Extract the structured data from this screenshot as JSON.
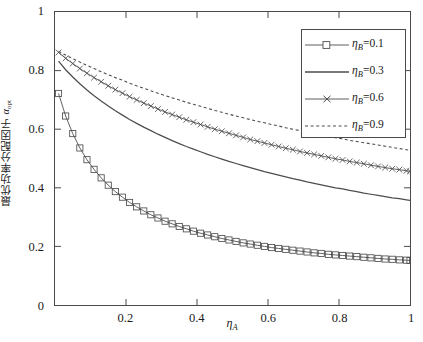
{
  "figure": {
    "background": "#ffffff",
    "axis_color": "#4a4a4a",
    "curve_color": "#4d4d4d"
  },
  "axes": {
    "x_label": "η",
    "x_label_sub": "A",
    "y_label_cn": "最优功率分配因子 ",
    "y_label_sym": "α",
    "y_label_sub": "opt",
    "x_ticks": [
      "0.2",
      "0.4",
      "0.6",
      "0.8",
      "1"
    ],
    "x_tick_values": [
      0.2,
      0.4,
      0.6,
      0.8,
      1
    ],
    "y_ticks": [
      "0",
      "0.2",
      "0.4",
      "0.6",
      "0.8",
      "1"
    ],
    "y_tick_values": [
      0,
      0.2,
      0.4,
      0.6,
      0.8,
      1
    ]
  },
  "legend": {
    "entries": [
      {
        "label": "η",
        "sub": "B",
        "eq": "=0.1",
        "style": "square"
      },
      {
        "label": "η",
        "sub": "B",
        "eq": "=0.3",
        "style": "solid"
      },
      {
        "label": "η",
        "sub": "B",
        "eq": "=0.6",
        "style": "cross"
      },
      {
        "label": "η",
        "sub": "B",
        "eq": "=0.9",
        "style": "dashed"
      }
    ]
  },
  "chart_data": {
    "type": "line",
    "title": "",
    "xlabel": "η_A",
    "ylabel": "最优功率分配因子 α_opt",
    "xlim": [
      0,
      1
    ],
    "ylim": [
      0,
      1
    ],
    "grid": false,
    "legend_position": "upper-right",
    "x": [
      0.01,
      0.03,
      0.05,
      0.07,
      0.09,
      0.11,
      0.13,
      0.15,
      0.17,
      0.19,
      0.21,
      0.23,
      0.25,
      0.27,
      0.29,
      0.31,
      0.33,
      0.35,
      0.37,
      0.39,
      0.41,
      0.43,
      0.45,
      0.47,
      0.49,
      0.51,
      0.53,
      0.55,
      0.57,
      0.59,
      0.61,
      0.63,
      0.65,
      0.67,
      0.69,
      0.71,
      0.73,
      0.75,
      0.77,
      0.79,
      0.81,
      0.83,
      0.85,
      0.87,
      0.89,
      0.91,
      0.93,
      0.95,
      0.97,
      0.99,
      1.0
    ],
    "series": [
      {
        "name": "η_B=0.1",
        "marker": "square",
        "linestyle": "solid",
        "values": [
          0.722,
          0.645,
          0.585,
          0.536,
          0.496,
          0.463,
          0.434,
          0.409,
          0.387,
          0.368,
          0.35,
          0.335,
          0.321,
          0.308,
          0.297,
          0.286,
          0.277,
          0.268,
          0.26,
          0.252,
          0.245,
          0.239,
          0.233,
          0.227,
          0.222,
          0.217,
          0.212,
          0.208,
          0.204,
          0.2,
          0.196,
          0.193,
          0.19,
          0.187,
          0.184,
          0.181,
          0.178,
          0.176,
          0.173,
          0.171,
          0.169,
          0.167,
          0.165,
          0.163,
          0.161,
          0.159,
          0.157,
          0.156,
          0.154,
          0.153,
          0.152
        ]
      },
      {
        "name": "η_B=0.3",
        "marker": "none",
        "linestyle": "solid",
        "values": [
          0.832,
          0.803,
          0.778,
          0.755,
          0.734,
          0.714,
          0.696,
          0.679,
          0.663,
          0.648,
          0.633,
          0.62,
          0.607,
          0.595,
          0.583,
          0.572,
          0.561,
          0.551,
          0.541,
          0.532,
          0.523,
          0.514,
          0.506,
          0.498,
          0.49,
          0.483,
          0.476,
          0.469,
          0.462,
          0.455,
          0.449,
          0.443,
          0.437,
          0.431,
          0.426,
          0.42,
          0.415,
          0.41,
          0.405,
          0.4,
          0.396,
          0.391,
          0.387,
          0.382,
          0.378,
          0.374,
          0.37,
          0.366,
          0.363,
          0.359,
          0.357
        ]
      },
      {
        "name": "η_B=0.6",
        "marker": "cross",
        "linestyle": "solid",
        "values": [
          0.862,
          0.842,
          0.824,
          0.807,
          0.791,
          0.776,
          0.762,
          0.748,
          0.735,
          0.723,
          0.711,
          0.7,
          0.689,
          0.679,
          0.669,
          0.659,
          0.65,
          0.641,
          0.632,
          0.624,
          0.616,
          0.608,
          0.6,
          0.593,
          0.586,
          0.579,
          0.572,
          0.565,
          0.559,
          0.553,
          0.547,
          0.541,
          0.535,
          0.53,
          0.524,
          0.519,
          0.514,
          0.509,
          0.504,
          0.499,
          0.495,
          0.49,
          0.486,
          0.482,
          0.477,
          0.473,
          0.469,
          0.465,
          0.462,
          0.458,
          0.456
        ]
      },
      {
        "name": "η_B=0.9",
        "marker": "none",
        "linestyle": "dashed",
        "values": [
          0.866,
          0.853,
          0.841,
          0.829,
          0.818,
          0.807,
          0.796,
          0.786,
          0.776,
          0.767,
          0.757,
          0.748,
          0.74,
          0.731,
          0.723,
          0.715,
          0.707,
          0.7,
          0.692,
          0.685,
          0.678,
          0.671,
          0.664,
          0.658,
          0.651,
          0.645,
          0.639,
          0.633,
          0.627,
          0.622,
          0.616,
          0.611,
          0.605,
          0.6,
          0.595,
          0.59,
          0.585,
          0.58,
          0.576,
          0.571,
          0.567,
          0.562,
          0.558,
          0.554,
          0.55,
          0.546,
          0.542,
          0.538,
          0.534,
          0.53,
          0.528
        ]
      }
    ]
  }
}
